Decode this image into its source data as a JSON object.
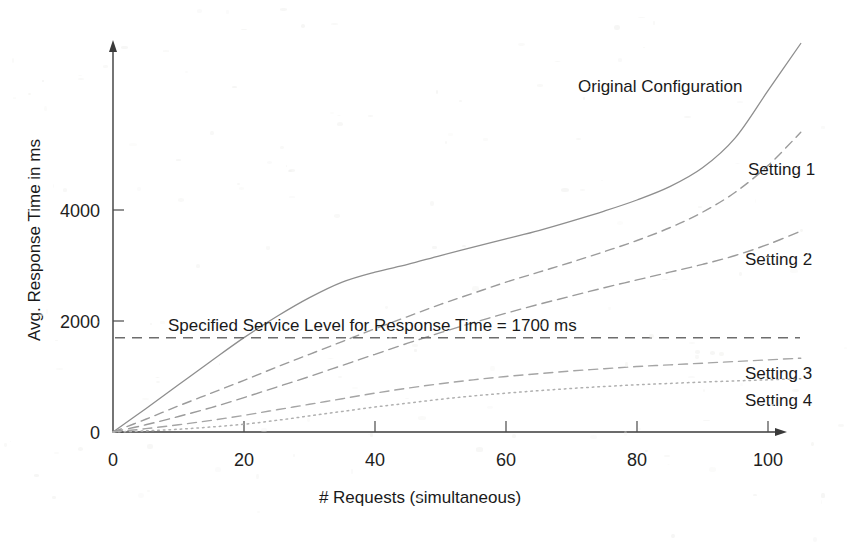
{
  "chart_data": {
    "type": "line",
    "title": "",
    "subtitle": "",
    "xlabel": "# Requests (simultaneous)",
    "ylabel": "Avg. Response Time in ms",
    "xlim": [
      0,
      107
    ],
    "ylim": [
      0,
      7000
    ],
    "grid": false,
    "legend_position": "inline-right-of-curves",
    "x_ticks": [
      "0",
      "20",
      "40",
      "60",
      "80",
      "100"
    ],
    "x_tick_values": [
      0,
      20,
      40,
      60,
      80,
      100
    ],
    "y_ticks": [
      "0",
      "2000",
      "4000"
    ],
    "y_tick_values": [
      0,
      2000,
      4000
    ],
    "x": [
      0,
      5,
      10,
      15,
      20,
      25,
      30,
      35,
      40,
      45,
      50,
      55,
      60,
      65,
      70,
      75,
      80,
      85,
      90,
      95,
      100,
      105
    ],
    "series": [
      {
        "name": "Original Configuration",
        "style": "solid",
        "color": "#8e8e8e",
        "label": "Original Configuration",
        "values": [
          0,
          420,
          850,
          1280,
          1700,
          2080,
          2420,
          2700,
          2880,
          3020,
          3180,
          3330,
          3480,
          3630,
          3800,
          3980,
          4180,
          4420,
          4760,
          5300,
          6150,
          7000
        ]
      },
      {
        "name": "Setting 1",
        "style": "dashed",
        "color": "#9b9b9b",
        "label": "Setting 1",
        "values": [
          0,
          230,
          470,
          700,
          930,
          1170,
          1400,
          1630,
          1860,
          2080,
          2300,
          2500,
          2700,
          2880,
          3060,
          3250,
          3450,
          3680,
          3960,
          4320,
          4800,
          5400
        ]
      },
      {
        "name": "Setting 2",
        "style": "dashed",
        "color": "#9b9b9b",
        "label": "Setting 2",
        "values": [
          0,
          130,
          280,
          440,
          620,
          810,
          1000,
          1200,
          1400,
          1600,
          1790,
          1970,
          2140,
          2300,
          2450,
          2600,
          2740,
          2880,
          3020,
          3180,
          3380,
          3620
        ]
      },
      {
        "name": "Setting 3",
        "style": "dashed",
        "color": "#a5a5a5",
        "label": "Setting 3",
        "values": [
          0,
          60,
          130,
          210,
          300,
          400,
          500,
          600,
          700,
          790,
          870,
          940,
          1000,
          1050,
          1100,
          1140,
          1180,
          1210,
          1240,
          1270,
          1300,
          1330
        ]
      },
      {
        "name": "Setting 4",
        "style": "dotted",
        "color": "#b0b0b0",
        "label": "Setting 4",
        "values": [
          0,
          20,
          50,
          90,
          140,
          210,
          290,
          370,
          450,
          520,
          590,
          650,
          700,
          745,
          785,
          820,
          850,
          875,
          900,
          920,
          940,
          960
        ]
      }
    ],
    "annotations": [
      {
        "name": "service-level-threshold",
        "text": "Specified Service Level for Response Time = 1700 ms",
        "value": 1700,
        "style": "dashed-horizontal-line",
        "color": "#6d6d6d"
      }
    ]
  },
  "labels": {
    "y_axis_title": "Avg. Response Time in ms",
    "x_axis_title": "# Requests (simultaneous)",
    "sla_text": "Specified Service Level for Response Time = 1700 ms",
    "series_original": "Original Configuration",
    "series_setting1": "Setting 1",
    "series_setting2": "Setting 2",
    "series_setting3": "Setting 3",
    "series_setting4": "Setting 4",
    "y_tick_0": "0",
    "y_tick_2000": "2000",
    "y_tick_4000": "4000",
    "x_tick_0": "0",
    "x_tick_20": "20",
    "x_tick_40": "40",
    "x_tick_60": "60",
    "x_tick_80": "80",
    "x_tick_100": "100"
  }
}
